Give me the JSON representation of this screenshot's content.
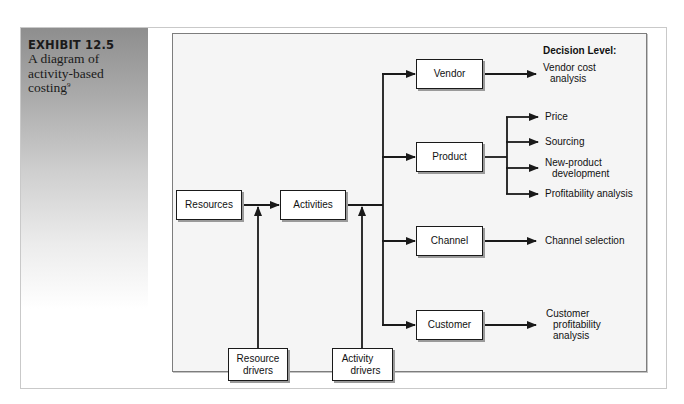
{
  "exhibit": {
    "number": "EXHIBIT 12.5",
    "caption": "A diagram of activity-based costing",
    "footnote_marker": "9"
  },
  "diagram": {
    "decision_level_title": "Decision Level:",
    "inputs": {
      "resources": "Resources",
      "activities": "Activities",
      "resource_drivers_line1": "Resource",
      "resource_drivers_line2": "drivers",
      "activity_drivers_line1": "Activity",
      "activity_drivers_line2": "drivers"
    },
    "cost_objects": [
      {
        "label": "Vendor"
      },
      {
        "label": "Product"
      },
      {
        "label": "Channel"
      },
      {
        "label": "Customer"
      }
    ],
    "decisions": {
      "vendor_line1": "Vendor cost",
      "vendor_line2": "analysis",
      "product": [
        "Price",
        "Sourcing",
        "New-product",
        "development",
        "Profitability analysis"
      ],
      "channel": "Channel selection",
      "customer_line1": "Customer",
      "customer_line2": "profitability",
      "customer_line3": "analysis"
    },
    "colors": {
      "panel_background": "#f5f5f5",
      "line": "#1a1a1a",
      "sidebar_gradient_top": "#8e8e8e",
      "sidebar_gradient_bottom": "#ffffff"
    }
  }
}
